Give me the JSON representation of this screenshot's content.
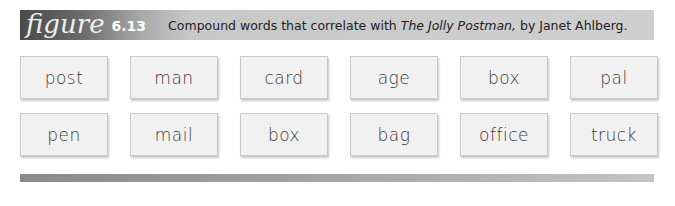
{
  "figure": {
    "label_word": "figure",
    "label_number": "6.13",
    "caption_before": "Compound words that correlate with ",
    "caption_title": "The Jolly Postman,",
    "caption_after": " by Janet Ahlberg."
  },
  "rows": [
    [
      "post",
      "man",
      "card",
      "age",
      "box",
      "pal"
    ],
    [
      "pen",
      "mail",
      "box",
      "bag",
      "office",
      "truck"
    ]
  ]
}
